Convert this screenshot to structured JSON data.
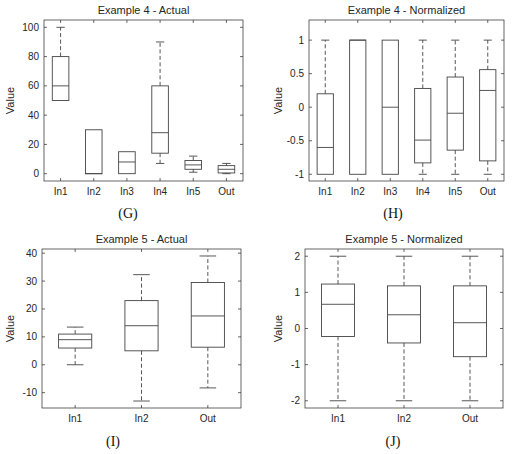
{
  "chart_data": [
    {
      "id": "G",
      "type": "box",
      "title": "Example 4 - Actual",
      "ylabel": "Value",
      "xlabel": "",
      "caption": "(G)",
      "categories": [
        "In1",
        "In2",
        "In3",
        "In4",
        "In5",
        "Out"
      ],
      "ylim": [
        -5,
        105
      ],
      "yticks": [
        0,
        20,
        40,
        60,
        80,
        100
      ],
      "boxes": [
        {
          "name": "In1",
          "whisker_low": 50,
          "q1": 50,
          "median": 60,
          "q3": 80,
          "whisker_high": 100
        },
        {
          "name": "In2",
          "whisker_low": 0,
          "q1": 0,
          "median": 0,
          "q3": 30,
          "whisker_high": 30
        },
        {
          "name": "In3",
          "whisker_low": 0,
          "q1": 0,
          "median": 8,
          "q3": 15,
          "whisker_high": 15
        },
        {
          "name": "In4",
          "whisker_low": 7,
          "q1": 14,
          "median": 28,
          "q3": 60,
          "whisker_high": 90
        },
        {
          "name": "In5",
          "whisker_low": 1,
          "q1": 3,
          "median": 6,
          "q3": 9,
          "whisker_high": 12
        },
        {
          "name": "Out",
          "whisker_low": 0,
          "q1": 0.5,
          "median": 3,
          "q3": 5.5,
          "whisker_high": 7
        }
      ]
    },
    {
      "id": "H",
      "type": "box",
      "title": "Example 4 - Normalized",
      "ylabel": "Value",
      "xlabel": "",
      "caption": "(H)",
      "categories": [
        "In1",
        "In2",
        "In3",
        "In4",
        "In5",
        "Out"
      ],
      "ylim": [
        -1.1,
        1.3
      ],
      "yticks": [
        -1,
        -0.5,
        0,
        0.5,
        1
      ],
      "boxes": [
        {
          "name": "In1",
          "whisker_low": -1,
          "q1": -1,
          "median": -0.6,
          "q3": 0.2,
          "whisker_high": 1
        },
        {
          "name": "In2",
          "whisker_low": -1,
          "q1": -1,
          "median": 1,
          "q3": 1,
          "whisker_high": 1
        },
        {
          "name": "In3",
          "whisker_low": -1,
          "q1": -1,
          "median": 0,
          "q3": 1,
          "whisker_high": 1
        },
        {
          "name": "In4",
          "whisker_low": -1,
          "q1": -0.83,
          "median": -0.49,
          "q3": 0.28,
          "whisker_high": 1
        },
        {
          "name": "In5",
          "whisker_low": -1,
          "q1": -0.64,
          "median": -0.09,
          "q3": 0.45,
          "whisker_high": 1
        },
        {
          "name": "Out",
          "whisker_low": -1,
          "q1": -0.8,
          "median": 0.25,
          "q3": 0.56,
          "whisker_high": 1
        }
      ]
    },
    {
      "id": "I",
      "type": "box",
      "title": "Example 5 - Actual",
      "ylabel": "Value",
      "xlabel": "",
      "caption": "(I)",
      "categories": [
        "In1",
        "In2",
        "Out"
      ],
      "ylim": [
        -15.5,
        41.5
      ],
      "yticks": [
        -10,
        0,
        10,
        20,
        30,
        40
      ],
      "boxes": [
        {
          "name": "In1",
          "whisker_low": 0,
          "q1": 6,
          "median": 9,
          "q3": 11,
          "whisker_high": 13.5
        },
        {
          "name": "In2",
          "whisker_low": -13,
          "q1": 5,
          "median": 14,
          "q3": 23,
          "whisker_high": 32.3
        },
        {
          "name": "Out",
          "whisker_low": -8.3,
          "q1": 6.3,
          "median": 17.5,
          "q3": 29.5,
          "whisker_high": 39
        }
      ]
    },
    {
      "id": "J",
      "type": "box",
      "title": "Example 5 - Normalized",
      "ylabel": "Value",
      "xlabel": "",
      "caption": "(J)",
      "categories": [
        "In1",
        "In2",
        "Out"
      ],
      "ylim": [
        -2.2,
        2.2
      ],
      "yticks": [
        -2,
        -1,
        0,
        1,
        2
      ],
      "boxes": [
        {
          "name": "In1",
          "whisker_low": -2,
          "q1": -0.22,
          "median": 0.67,
          "q3": 1.23,
          "whisker_high": 2
        },
        {
          "name": "In2",
          "whisker_low": -2,
          "q1": -0.4,
          "median": 0.38,
          "q3": 1.18,
          "whisker_high": 2
        },
        {
          "name": "Out",
          "whisker_low": -2,
          "q1": -0.78,
          "median": 0.16,
          "q3": 1.18,
          "whisker_high": 2
        }
      ]
    }
  ]
}
